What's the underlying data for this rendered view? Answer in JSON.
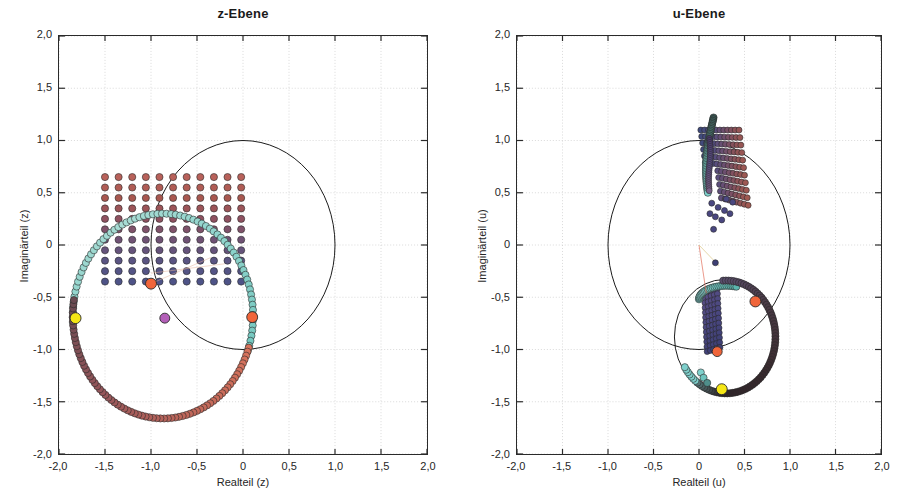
{
  "figure": {
    "background": "#ffffff",
    "axis_color": "#2a2a2a",
    "grid_color": "#c9c9c9",
    "text_color": "#262626"
  },
  "chart_data": [
    {
      "id": "z-plane",
      "type": "scatter",
      "title": "z-Ebene",
      "xlabel": "Realteil (z)",
      "ylabel": "Imaginärteil (z)",
      "xlim": [
        -2.0,
        2.0
      ],
      "ylim": [
        -2.0,
        2.0
      ],
      "grid": true,
      "xticks": [
        "-2,0",
        "-1,5",
        "-1,0",
        "-0,5",
        "0",
        "0,5",
        "1,0",
        "1,5",
        "2,0"
      ],
      "xtick_values": [
        -2.0,
        -1.5,
        -1.0,
        -0.5,
        0,
        0.5,
        1.0,
        1.5,
        2.0
      ],
      "yticks": [
        "2,0",
        "1,5",
        "1,0",
        "0,5",
        "0",
        "-0,5",
        "-1,0",
        "-1,5",
        "-2,0"
      ],
      "ytick_values": [
        2.0,
        1.5,
        1.0,
        0.5,
        0,
        -0.5,
        -1.0,
        -1.5,
        -2.0
      ],
      "annotations": [
        {
          "name": "unit-circle",
          "kind": "circle",
          "cx": 0,
          "cy": 0,
          "r": 1.0,
          "stroke": "#1a1a1a"
        },
        {
          "name": "mapped-circle",
          "kind": "circle",
          "cx": -0.87,
          "cy": -0.68,
          "r": 0.98,
          "stroke": "#1a1a1a"
        }
      ],
      "series": [
        {
          "name": "rechteck-gitter",
          "marker": "circle",
          "marker_size": 7,
          "x_range": [
            -1.5,
            -0.02
          ],
          "y_range": [
            -0.35,
            0.65
          ],
          "nx": 11,
          "ny": 11,
          "colormap": [
            "#b8615a",
            "#a8574f",
            "#8f5160",
            "#6f5274",
            "#5a5482",
            "#4e5387"
          ]
        },
        {
          "name": "einheitskreis-bild-kurve",
          "marker": "circle",
          "marker_size": 7,
          "color_start": "#8fd4cc",
          "color_end": "#9fd6cf",
          "path_note": "grosser Kreisbogen durch z=-1,8-0,7i und z=0,1-0,7i"
        },
        {
          "name": "unterer-kreisbogen",
          "marker": "circle",
          "marker_size": 7,
          "color_start": "#d0705f",
          "color_end": "#6a4a52"
        }
      ],
      "highlight_points": [
        {
          "name": "marker-orange-links",
          "x": -1.0,
          "y": -0.37,
          "color": "#f0653a",
          "size": 11
        },
        {
          "name": "marker-orange-rechts",
          "x": 0.1,
          "y": -0.69,
          "color": "#f0653a",
          "size": 11
        },
        {
          "name": "marker-gelb",
          "x": -1.82,
          "y": -0.7,
          "color": "#f5e615",
          "size": 11
        },
        {
          "name": "marker-magenta",
          "x": -0.85,
          "y": -0.7,
          "color": "#b35fb8",
          "size": 10
        }
      ]
    },
    {
      "id": "u-plane",
      "type": "scatter",
      "title": "u-Ebene",
      "xlabel": "Realteil (u)",
      "ylabel": "Imaginärteil (u)",
      "xlim": [
        -2.0,
        2.0
      ],
      "ylim": [
        -2.0,
        2.0
      ],
      "grid": true,
      "xticks": [
        "-2,0",
        "-1,5",
        "-1,0",
        "-0,5",
        "0",
        "0,5",
        "1,0",
        "1,5",
        "2,0"
      ],
      "xtick_values": [
        -2.0,
        -1.5,
        -1.0,
        -0.5,
        0,
        0.5,
        1.0,
        1.5,
        2.0
      ],
      "yticks": [
        "2,0",
        "1,5",
        "1,0",
        "0,5",
        "0",
        "-0,5",
        "-1,0",
        "-1,5",
        "-2,0"
      ],
      "ytick_values": [
        2.0,
        1.5,
        1.0,
        0.5,
        0,
        -0.5,
        -1.0,
        -1.5,
        -2.0
      ],
      "annotations": [
        {
          "name": "unit-circle",
          "kind": "circle",
          "cx": 0,
          "cy": 0,
          "r": 1.0,
          "stroke": "#1a1a1a"
        },
        {
          "name": "mapped-circle",
          "kind": "circle",
          "cx": 0.28,
          "cy": -0.88,
          "r": 0.55,
          "stroke": "#1a1a1a"
        }
      ],
      "series": [
        {
          "name": "oberes-gitterbild",
          "marker": "circle",
          "marker_size": 6,
          "colormap": [
            "#a35a50",
            "#8c5258",
            "#6d4f70",
            "#514d82",
            "#3f4a7d"
          ]
        },
        {
          "name": "unteres-gitterbild",
          "marker": "circle",
          "marker_size": 6,
          "colormap": [
            "#5a4f86",
            "#4a4780",
            "#3d3f74"
          ]
        },
        {
          "name": "kreisbogen-oben",
          "marker": "circle",
          "marker_size": 7,
          "color_start": "#3a5a56",
          "color_end": "#7ed0cc"
        },
        {
          "name": "kreisbogen-unten",
          "marker": "circle",
          "marker_size": 7,
          "color_start": "#7ed0cc",
          "color_end": "#3b2b30"
        }
      ],
      "highlight_points": [
        {
          "name": "marker-orange-oben",
          "x": 0.62,
          "y": -0.54,
          "color": "#f0653a",
          "size": 11
        },
        {
          "name": "marker-orange-unten",
          "x": 0.2,
          "y": -1.02,
          "color": "#f0653a",
          "size": 10
        },
        {
          "name": "marker-gelb",
          "x": 0.25,
          "y": -1.38,
          "color": "#f5e615",
          "size": 11
        }
      ]
    }
  ]
}
